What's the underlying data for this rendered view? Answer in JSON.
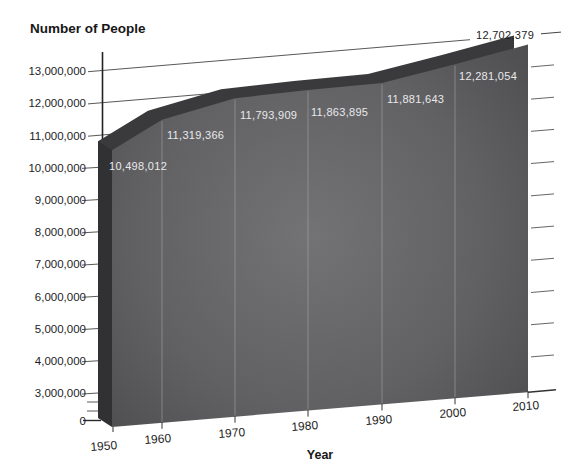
{
  "title": "Number of People",
  "chart_data": {
    "type": "area",
    "style": "3d-beveled-area",
    "title": "Number of People",
    "xlabel": "Year",
    "ylabel": "Number of People",
    "x": [
      1950,
      1960,
      1970,
      1980,
      1990,
      2000,
      2010
    ],
    "values": [
      10498012,
      11319366,
      11793909,
      11863895,
      11881643,
      12281054,
      12702379
    ],
    "point_labels": [
      "10,498,012",
      "11,319,366",
      "11,793,909",
      "11,863,895",
      "11,881,643",
      "12,281,054",
      "12,702,379"
    ],
    "x_tick_labels": [
      "1950",
      "1960",
      "1970",
      "1980",
      "1990",
      "2000",
      "2010"
    ],
    "y_tick_labels": [
      "13,000,000",
      "12,000,000",
      "11,000,000",
      "10,000,000",
      "9,000,000",
      "8,000,000",
      "7,000,000",
      "6,000,000",
      "5,000,000",
      "4,000,000",
      "3,000,000",
      "0"
    ],
    "y_ticks": [
      13000000,
      12000000,
      11000000,
      10000000,
      9000000,
      8000000,
      7000000,
      6000000,
      5000000,
      4000000,
      3000000,
      0
    ],
    "y_minor_ticks": [
      2000000,
      1000000
    ],
    "y_axis_note": "scale compressed between 0 and 3,000,000",
    "ylim": [
      0,
      13000000
    ],
    "grid": true,
    "legend": false
  },
  "colors": {
    "background": "#ffffff",
    "area_front_center": "#747477",
    "area_front_edge": "#47474a",
    "area_bevel_top": "#3a3a3c",
    "area_bevel_left": "#313133",
    "decade_line": "#aaaaac",
    "gridline": "#454545",
    "axis_line": "#222222",
    "label_on_area": "#e9e9eb",
    "text": "#1d1d1d"
  }
}
